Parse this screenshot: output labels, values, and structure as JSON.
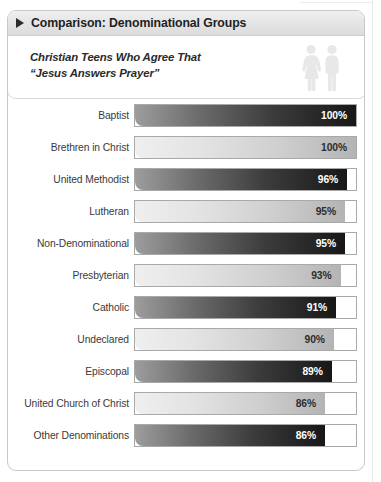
{
  "header": {
    "title": "Comparison: Denominational Groups",
    "marker_icon": "triangle-right-icon"
  },
  "subtitle": {
    "line1": "Christian Teens Who Agree That",
    "line2": "“Jesus Answers Prayer”",
    "text": "Christian Teens Who Agree That\n“Jesus Answers Prayer”",
    "icon": "two-people-icon"
  },
  "colors": {
    "card_border": "#c8c8c8",
    "header_bg": "#e4e4e4",
    "bar_dark_start": "#9d9d9d",
    "bar_dark_end": "#171717",
    "bar_light_start": "#efefef",
    "bar_light_end": "#b4b4b4",
    "track_border": "#a9a9a9",
    "label_text": "#3a3a3a"
  },
  "chart_data": {
    "type": "bar",
    "title": "Comparison: Denominational Groups",
    "subtitle": "Christian Teens Who Agree That “Jesus Answers Prayer”",
    "orientation": "horizontal",
    "xlabel": "",
    "ylabel": "",
    "xlim": [
      0,
      100
    ],
    "grid": false,
    "legend": null,
    "unit": "%",
    "categories": [
      "Baptist",
      "Brethren in Christ",
      "United Methodist",
      "Lutheran",
      "Non-Denominational",
      "Presbyterian",
      "Catholic",
      "Undeclared",
      "Episcopal",
      "United Church of Christ",
      "Other Denominations"
    ],
    "values": [
      100,
      100,
      96,
      95,
      95,
      93,
      91,
      90,
      89,
      86,
      86
    ],
    "value_labels": [
      "100%",
      "100%",
      "96%",
      "95%",
      "95%",
      "93%",
      "91%",
      "90%",
      "89%",
      "86%",
      "86%"
    ],
    "bar_styles": [
      "dark",
      "light",
      "dark",
      "light",
      "dark",
      "light",
      "dark",
      "light",
      "dark",
      "light",
      "dark"
    ],
    "rows": [
      {
        "label": "Baptist",
        "value": 100,
        "value_label": "100%",
        "style": "dark"
      },
      {
        "label": "Brethren in Christ",
        "value": 100,
        "value_label": "100%",
        "style": "light"
      },
      {
        "label": "United Methodist",
        "value": 96,
        "value_label": "96%",
        "style": "dark"
      },
      {
        "label": "Lutheran",
        "value": 95,
        "value_label": "95%",
        "style": "light"
      },
      {
        "label": "Non-Denominational",
        "value": 95,
        "value_label": "95%",
        "style": "dark"
      },
      {
        "label": "Presbyterian",
        "value": 93,
        "value_label": "93%",
        "style": "light"
      },
      {
        "label": "Catholic",
        "value": 91,
        "value_label": "91%",
        "style": "dark"
      },
      {
        "label": "Undeclared",
        "value": 90,
        "value_label": "90%",
        "style": "light"
      },
      {
        "label": "Episcopal",
        "value": 89,
        "value_label": "89%",
        "style": "dark"
      },
      {
        "label": "United Church of Christ",
        "value": 86,
        "value_label": "86%",
        "style": "light"
      },
      {
        "label": "Other Denominations",
        "value": 86,
        "value_label": "86%",
        "style": "dark"
      }
    ]
  }
}
